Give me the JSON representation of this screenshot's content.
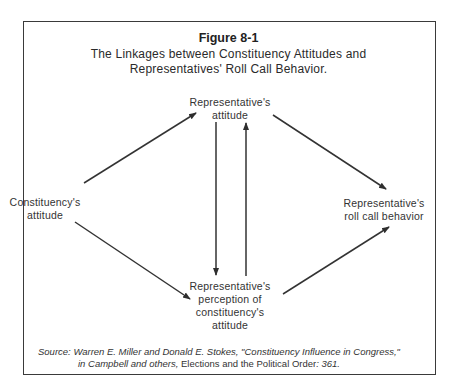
{
  "figure": {
    "number": "Figure 8-1",
    "title_line1": "The Linkages between Constituency Attitudes and",
    "title_line2": "Representatives' Roll Call Behavior."
  },
  "nodes": {
    "representative_attitude": {
      "line1": "Representative's",
      "line2": "attitude"
    },
    "constituency_attitude": {
      "line1": "Constituency's",
      "line2": "attitude"
    },
    "representative_roll_call": {
      "line1": "Representative's",
      "line2": "roll call behavior"
    },
    "representative_perception": {
      "line1": "Representative's",
      "line2": "perception of",
      "line3": "constituency's",
      "line4": "attitude"
    }
  },
  "edges": [
    {
      "from": "Constituency's attitude",
      "to": "Representative's attitude"
    },
    {
      "from": "Constituency's attitude",
      "to": "Representative's perception of constituency's attitude"
    },
    {
      "from": "Representative's attitude",
      "to": "Representative's perception of constituency's attitude"
    },
    {
      "from": "Representative's perception of constituency's attitude",
      "to": "Representative's attitude"
    },
    {
      "from": "Representative's attitude",
      "to": "Representative's roll call behavior"
    },
    {
      "from": "Representative's perception of constituency's attitude",
      "to": "Representative's roll call behavior"
    }
  ],
  "source": {
    "label": "Source:",
    "line1": "Warren E. Miller and Donald E. Stokes, \"Constituency Influence in Congress,\"",
    "line2_italic": "in Campbell and others,",
    "line2_upright": " Elections and the Political Order",
    "line2_page": ": 361."
  },
  "colors": {
    "line": "#333333",
    "text": "#2a2a2a",
    "background": "#ffffff"
  }
}
